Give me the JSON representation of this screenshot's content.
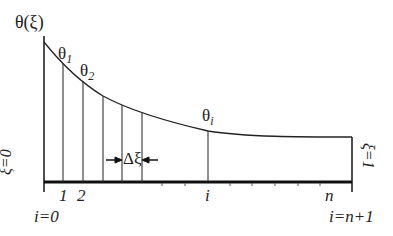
{
  "diagram": {
    "y_axis_label": "θ(ξ)",
    "curve_labels": [
      {
        "base": "θ",
        "sub": "1"
      },
      {
        "base": "θ",
        "sub": "2"
      },
      {
        "base": "θ",
        "sub": "i"
      }
    ],
    "step_label": "Δξ",
    "left_boundary": "ξ=0",
    "right_boundary": "ξ=1",
    "node_labels": [
      "1",
      "2",
      "i",
      "n"
    ],
    "left_index": "i=0",
    "right_index": "i=n+1",
    "colors": {
      "line": "#222222",
      "base": "#111111"
    }
  }
}
